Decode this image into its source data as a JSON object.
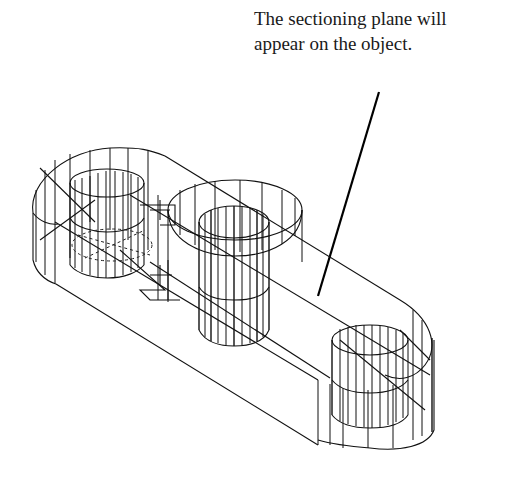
{
  "figure": {
    "caption_lines": [
      "The sectioning plane will",
      "appear on the object."
    ],
    "leader": {
      "from": [
        379,
        92
      ],
      "to": [
        318,
        296
      ]
    },
    "colors": {
      "line": "#111111",
      "background": "#ffffff"
    }
  }
}
